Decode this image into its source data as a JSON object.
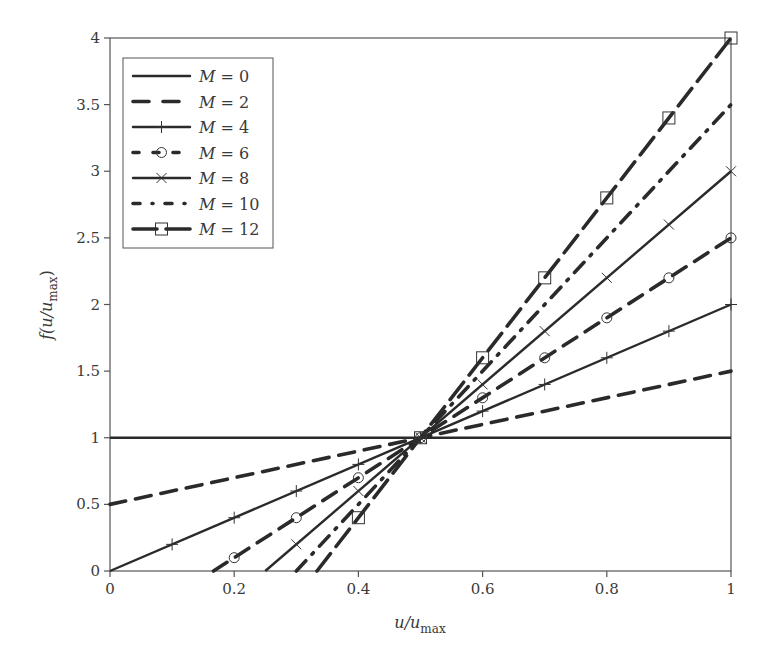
{
  "chart_data": {
    "type": "line",
    "title": "",
    "xlabel": "u/u_max",
    "ylabel": "f(u/u_max)",
    "xlim": [
      0,
      1
    ],
    "ylim": [
      0,
      4
    ],
    "x_ticks": [
      "0",
      "0.2",
      "0.4",
      "0.6",
      "0.8",
      "1"
    ],
    "y_ticks": [
      "0",
      "0.5",
      "1",
      "1.5",
      "2",
      "2.5",
      "3",
      "3.5",
      "4"
    ],
    "grid": false,
    "legend_position": "upper left",
    "formula_hint": "f = 1 + (M/2)(u/u_max - 0.5), clipped to [0,4]",
    "x": [
      0,
      0.1,
      0.2,
      0.3,
      0.4,
      0.5,
      0.6,
      0.7,
      0.8,
      0.9,
      1.0
    ],
    "series": [
      {
        "name": "M = 0",
        "M": 0,
        "style": "solid",
        "marker": "none",
        "values": [
          1,
          1,
          1,
          1,
          1,
          1,
          1,
          1,
          1,
          1,
          1
        ]
      },
      {
        "name": "M = 2",
        "M": 2,
        "style": "dashed",
        "marker": "none",
        "values": [
          0.5,
          0.6,
          0.7,
          0.8,
          0.9,
          1.0,
          1.1,
          1.2,
          1.3,
          1.4,
          1.5
        ]
      },
      {
        "name": "M = 4",
        "M": 4,
        "style": "solid",
        "marker": "plus",
        "values": [
          0,
          0.2,
          0.4,
          0.6,
          0.8,
          1.0,
          1.2,
          1.4,
          1.6,
          1.8,
          2.0
        ]
      },
      {
        "name": "M = 6",
        "M": 6,
        "style": "dashed",
        "marker": "circle",
        "values": [
          null,
          null,
          0.1,
          0.4,
          0.7,
          1.0,
          1.3,
          1.6,
          1.9,
          2.2,
          2.5
        ]
      },
      {
        "name": "M = 8",
        "M": 8,
        "style": "solid",
        "marker": "cross",
        "values": [
          null,
          null,
          null,
          0.2,
          0.6,
          1.0,
          1.4,
          1.8,
          2.2,
          2.6,
          3.0
        ]
      },
      {
        "name": "M = 10",
        "M": 10,
        "style": "dashdot",
        "marker": "none",
        "values": [
          null,
          null,
          null,
          null,
          0.5,
          1.0,
          1.5,
          2.0,
          2.5,
          3.0,
          3.5
        ]
      },
      {
        "name": "M = 12",
        "M": 12,
        "style": "longdash",
        "marker": "square",
        "values": [
          null,
          null,
          null,
          null,
          0.4,
          1.0,
          1.6,
          2.2,
          2.8,
          3.4,
          4.0
        ]
      }
    ]
  },
  "legend": {
    "items": [
      "M = 0",
      "M = 2",
      "M = 4",
      "M = 6",
      "M = 8",
      "M = 10",
      "M = 12"
    ]
  },
  "axes": {
    "xlabel_main": "u/u",
    "xlabel_sub": "max",
    "ylabel_main": "f(u/u",
    "ylabel_sub": "max",
    "ylabel_close": ")"
  },
  "colors": {
    "line": "#2a2a2a",
    "axis": "#555555",
    "text": "#3a3a3a"
  }
}
